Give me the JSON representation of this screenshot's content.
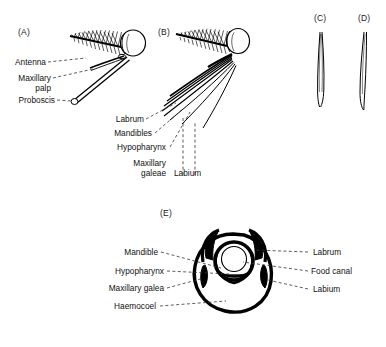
{
  "figure": {
    "panels": [
      {
        "letter": "(A)",
        "name": "panel-a-mosquito-head-lateral",
        "labels": [
          {
            "text": "Antenna",
            "name": "label-antenna"
          },
          {
            "text": "Maxillary",
            "name": "label-maxillary-palp-line1"
          },
          {
            "text": "palp",
            "name": "label-maxillary-palp-line2"
          },
          {
            "text": "Proboscis",
            "name": "label-proboscis"
          }
        ]
      },
      {
        "letter": "(B)",
        "name": "panel-b-mouthparts-separated",
        "labels": [
          {
            "text": "Labrum",
            "name": "label-labrum"
          },
          {
            "text": "Mandibles",
            "name": "label-mandibles"
          },
          {
            "text": "Hypopharynx",
            "name": "label-hypopharynx"
          },
          {
            "text": "Maxillary",
            "name": "label-maxillary-galeae-line1"
          },
          {
            "text": "galeae",
            "name": "label-maxillary-galeae-line2"
          },
          {
            "text": "Labium",
            "name": "label-labium"
          }
        ]
      },
      {
        "letter": "(C)",
        "name": "panel-c-stylet-tip",
        "labels": []
      },
      {
        "letter": "(D)",
        "name": "panel-d-stylet-tip",
        "labels": []
      },
      {
        "letter": "(E)",
        "name": "panel-e-proboscis-cross-section",
        "labels_left": [
          {
            "text": "Mandible",
            "name": "label-mandible"
          },
          {
            "text": "Hypopharynx",
            "name": "label-hypopharynx"
          },
          {
            "text": "Maxillary galea",
            "name": "label-maxillary-galea"
          },
          {
            "text": "Haemocoel",
            "name": "label-haemocoel"
          }
        ],
        "labels_right": [
          {
            "text": "Labrum",
            "name": "label-labrum"
          },
          {
            "text": "Food canal",
            "name": "label-food-canal"
          },
          {
            "text": "Labium",
            "name": "label-labium"
          }
        ]
      }
    ],
    "colors": {
      "ink": "#000000",
      "background": "#ffffff",
      "leader": "#333333"
    }
  }
}
